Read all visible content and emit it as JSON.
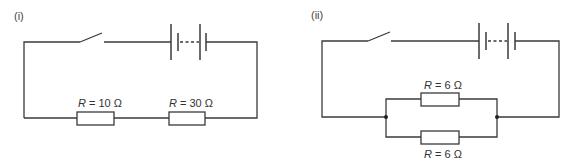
{
  "circuits": [
    {
      "id": "i",
      "panel_label": "(i)",
      "configuration": "series",
      "components": [
        "switch",
        "battery",
        "resistor",
        "resistor"
      ],
      "resistors": [
        {
          "symbol": "R",
          "equals": " = ",
          "value": "10 Ω",
          "label": "R = 10 Ω"
        },
        {
          "symbol": "R",
          "equals": " = ",
          "value": "30 Ω",
          "label": "R = 30 Ω"
        }
      ]
    },
    {
      "id": "ii",
      "panel_label": "(ii)",
      "configuration": "parallel",
      "components": [
        "switch",
        "battery",
        "resistor",
        "resistor"
      ],
      "resistors": [
        {
          "symbol": "R",
          "equals": " = ",
          "value": "6 Ω",
          "label": "R = 6 Ω"
        },
        {
          "symbol": "R",
          "equals": " = ",
          "value": "6 Ω",
          "label": "R = 6 Ω"
        }
      ]
    }
  ],
  "colors": {
    "wire": "#3a3a3a",
    "background": "#ffffff"
  }
}
